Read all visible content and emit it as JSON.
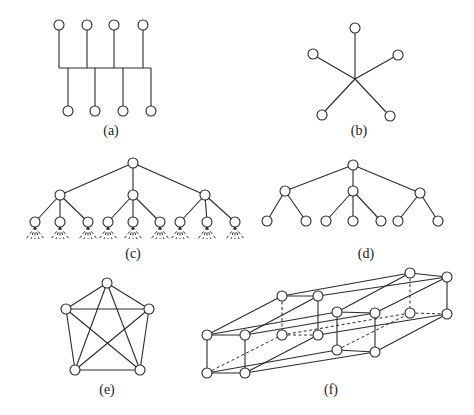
{
  "figure": {
    "node_radius": 5,
    "colors": {
      "stroke": "#2a2a2a",
      "node_fill": "#ffffff",
      "background": "#ffffff"
    },
    "panels": [
      {
        "id": "a",
        "label": "(a)",
        "label_pos": [
          111,
          135
        ],
        "kind": "bus",
        "nodes": [
          [
            59,
            25
          ],
          [
            87,
            25
          ],
          [
            114,
            25
          ],
          [
            143,
            25
          ],
          [
            68,
            111
          ],
          [
            95,
            111
          ],
          [
            123,
            111
          ],
          [
            151,
            111
          ]
        ],
        "edges": [
          [
            59,
            30,
            59,
            68
          ],
          [
            87,
            30,
            87,
            68
          ],
          [
            114,
            30,
            114,
            68
          ],
          [
            143,
            30,
            143,
            68
          ],
          [
            59,
            68,
            151,
            68
          ],
          [
            68,
            68,
            68,
            106
          ],
          [
            95,
            68,
            95,
            106
          ],
          [
            123,
            68,
            123,
            106
          ],
          [
            151,
            68,
            151,
            106
          ]
        ],
        "dashed": []
      },
      {
        "id": "b",
        "label": "(b)",
        "label_pos": [
          359,
          135
        ],
        "kind": "star",
        "nodes": [
          [
            355,
            28
          ],
          [
            313,
            54
          ],
          [
            398,
            55
          ],
          [
            322,
            115
          ],
          [
            390,
            116
          ]
        ],
        "edges": [
          [
            355,
            33,
            355,
            79
          ],
          [
            317,
            57,
            355,
            79
          ],
          [
            394,
            57,
            355,
            79
          ],
          [
            325,
            111,
            355,
            79
          ],
          [
            386,
            112,
            355,
            79
          ]
        ],
        "dashed": []
      },
      {
        "id": "c",
        "label": "(c)",
        "label_pos": [
          133,
          258
        ],
        "kind": "tree",
        "nodes": [
          [
            133,
            163
          ],
          [
            60,
            195
          ],
          [
            133,
            195
          ],
          [
            205,
            195
          ],
          [
            35,
            222
          ],
          [
            60,
            222
          ],
          [
            88,
            222
          ],
          [
            108,
            222
          ],
          [
            133,
            222
          ],
          [
            160,
            222
          ],
          [
            180,
            222
          ],
          [
            207,
            222
          ],
          [
            235,
            222
          ]
        ],
        "edges": [
          [
            133,
            163,
            60,
            195
          ],
          [
            133,
            163,
            133,
            195
          ],
          [
            133,
            163,
            205,
            195
          ],
          [
            60,
            195,
            35,
            222
          ],
          [
            60,
            195,
            60,
            222
          ],
          [
            60,
            195,
            88,
            222
          ],
          [
            133,
            195,
            108,
            222
          ],
          [
            133,
            195,
            133,
            222
          ],
          [
            133,
            195,
            160,
            222
          ],
          [
            205,
            195,
            180,
            222
          ],
          [
            205,
            195,
            207,
            222
          ],
          [
            205,
            195,
            235,
            222
          ]
        ],
        "dashed": [
          [
            35,
            227,
            26,
            239
          ],
          [
            35,
            227,
            31,
            239
          ],
          [
            35,
            227,
            35,
            239
          ],
          [
            35,
            227,
            39,
            239
          ],
          [
            35,
            227,
            44,
            239
          ],
          [
            60,
            227,
            51,
            239
          ],
          [
            60,
            227,
            56,
            239
          ],
          [
            60,
            227,
            60,
            239
          ],
          [
            60,
            227,
            64,
            239
          ],
          [
            60,
            227,
            69,
            239
          ],
          [
            88,
            227,
            79,
            239
          ],
          [
            88,
            227,
            84,
            239
          ],
          [
            88,
            227,
            88,
            239
          ],
          [
            88,
            227,
            92,
            239
          ],
          [
            88,
            227,
            97,
            239
          ],
          [
            108,
            227,
            99,
            239
          ],
          [
            108,
            227,
            104,
            239
          ],
          [
            108,
            227,
            108,
            239
          ],
          [
            108,
            227,
            112,
            239
          ],
          [
            108,
            227,
            117,
            239
          ],
          [
            133,
            227,
            124,
            239
          ],
          [
            133,
            227,
            129,
            239
          ],
          [
            133,
            227,
            133,
            239
          ],
          [
            133,
            227,
            137,
            239
          ],
          [
            133,
            227,
            142,
            239
          ],
          [
            160,
            227,
            151,
            239
          ],
          [
            160,
            227,
            156,
            239
          ],
          [
            160,
            227,
            160,
            239
          ],
          [
            160,
            227,
            164,
            239
          ],
          [
            160,
            227,
            169,
            239
          ],
          [
            180,
            227,
            171,
            239
          ],
          [
            180,
            227,
            176,
            239
          ],
          [
            180,
            227,
            180,
            239
          ],
          [
            180,
            227,
            184,
            239
          ],
          [
            180,
            227,
            189,
            239
          ],
          [
            207,
            227,
            198,
            239
          ],
          [
            207,
            227,
            203,
            239
          ],
          [
            207,
            227,
            207,
            239
          ],
          [
            207,
            227,
            211,
            239
          ],
          [
            207,
            227,
            216,
            239
          ],
          [
            235,
            227,
            226,
            239
          ],
          [
            235,
            227,
            231,
            239
          ],
          [
            235,
            227,
            235,
            239
          ],
          [
            235,
            227,
            239,
            239
          ],
          [
            235,
            227,
            244,
            239
          ]
        ]
      },
      {
        "id": "d",
        "label": "(d)",
        "label_pos": [
          366,
          258
        ],
        "kind": "tree",
        "nodes": [
          [
            353,
            165
          ],
          [
            285,
            191
          ],
          [
            353,
            191
          ],
          [
            420,
            193
          ],
          [
            267,
            221
          ],
          [
            306,
            221
          ],
          [
            326,
            221
          ],
          [
            353,
            221
          ],
          [
            381,
            221
          ],
          [
            398,
            221
          ],
          [
            438,
            221
          ]
        ],
        "edges": [
          [
            353,
            165,
            285,
            191
          ],
          [
            353,
            165,
            353,
            191
          ],
          [
            353,
            165,
            420,
            193
          ],
          [
            285,
            191,
            267,
            221
          ],
          [
            285,
            191,
            306,
            221
          ],
          [
            353,
            191,
            326,
            221
          ],
          [
            353,
            191,
            353,
            221
          ],
          [
            353,
            191,
            381,
            221
          ],
          [
            420,
            193,
            398,
            221
          ],
          [
            420,
            193,
            438,
            221
          ]
        ],
        "dashed": []
      },
      {
        "id": "e",
        "label": "(e)",
        "label_pos": [
          107,
          394
        ],
        "kind": "complete-graph-k5",
        "nodes": [
          [
            107,
            283
          ],
          [
            66,
            309
          ],
          [
            149,
            309
          ],
          [
            75,
            370
          ],
          [
            140,
            370
          ]
        ],
        "edges": [
          [
            107,
            283,
            66,
            309
          ],
          [
            107,
            283,
            149,
            309
          ],
          [
            107,
            283,
            75,
            370
          ],
          [
            107,
            283,
            140,
            370
          ],
          [
            66,
            309,
            149,
            309
          ],
          [
            66,
            309,
            75,
            370
          ],
          [
            66,
            309,
            140,
            370
          ],
          [
            149,
            309,
            75,
            370
          ],
          [
            149,
            309,
            140,
            370
          ],
          [
            75,
            370,
            140,
            370
          ]
        ],
        "dashed": []
      },
      {
        "id": "f",
        "label": "(f)",
        "label_pos": [
          331,
          394
        ],
        "kind": "hypercube-4d",
        "nodes": [
          [
            207,
            335
          ],
          [
            245,
            335
          ],
          [
            207,
            373
          ],
          [
            245,
            373
          ],
          [
            282,
            296
          ],
          [
            318,
            296
          ],
          [
            282,
            335
          ],
          [
            318,
            335
          ],
          [
            337,
            312
          ],
          [
            375,
            313
          ],
          [
            337,
            350
          ],
          [
            375,
            352
          ],
          [
            410,
            273
          ],
          [
            447,
            277
          ],
          [
            410,
            313
          ],
          [
            447,
            314
          ]
        ],
        "edges": [
          [
            207,
            335,
            245,
            335
          ],
          [
            207,
            335,
            207,
            373
          ],
          [
            245,
            335,
            245,
            373
          ],
          [
            207,
            373,
            245,
            373
          ],
          [
            282,
            296,
            318,
            296
          ],
          [
            318,
            296,
            318,
            335
          ],
          [
            337,
            312,
            375,
            313
          ],
          [
            337,
            312,
            337,
            350
          ],
          [
            375,
            313,
            375,
            352
          ],
          [
            337,
            350,
            375,
            352
          ],
          [
            410,
            273,
            447,
            277
          ],
          [
            447,
            277,
            447,
            314
          ],
          [
            207,
            335,
            282,
            296
          ],
          [
            245,
            335,
            318,
            296
          ],
          [
            245,
            373,
            318,
            335
          ],
          [
            337,
            312,
            410,
            273
          ],
          [
            375,
            313,
            447,
            277
          ],
          [
            375,
            352,
            447,
            314
          ],
          [
            282,
            296,
            410,
            273
          ],
          [
            318,
            296,
            447,
            277
          ],
          [
            318,
            335,
            447,
            314
          ],
          [
            207,
            335,
            337,
            312
          ],
          [
            245,
            335,
            375,
            313
          ],
          [
            207,
            373,
            337,
            350
          ],
          [
            245,
            373,
            375,
            352
          ]
        ],
        "dashed": [
          [
            282,
            296,
            282,
            335
          ],
          [
            282,
            335,
            318,
            335
          ],
          [
            207,
            373,
            282,
            335
          ],
          [
            410,
            273,
            410,
            313
          ],
          [
            410,
            313,
            447,
            314
          ],
          [
            337,
            350,
            410,
            313
          ],
          [
            282,
            335,
            410,
            313
          ]
        ]
      }
    ]
  }
}
